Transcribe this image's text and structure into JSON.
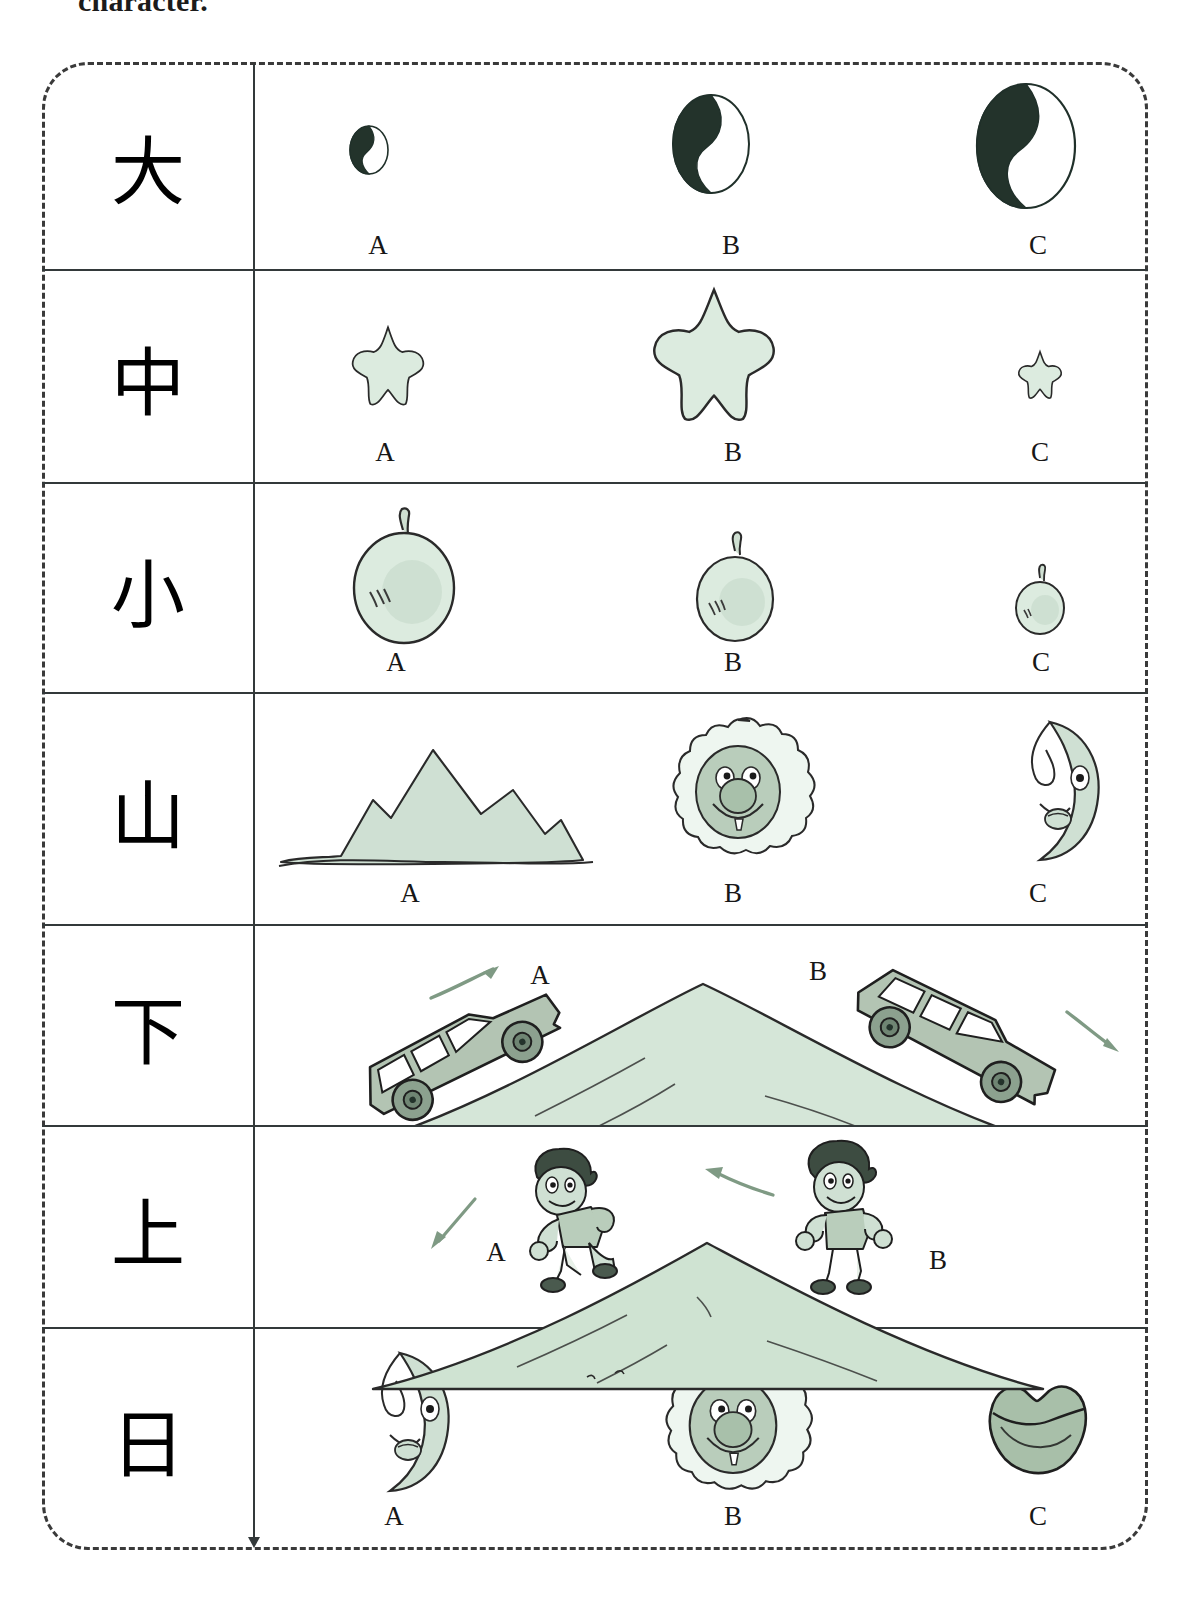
{
  "instruction": {
    "text": "character."
  },
  "worksheet": {
    "title": "Chinese character picture-matching worksheet",
    "border_style": "dashed-rounded",
    "columns": [
      "character",
      "options"
    ],
    "option_labels": [
      "A",
      "B",
      "C"
    ],
    "colors": {
      "ink": "#33393a",
      "pale_green": "#dcebdf",
      "mid_green": "#b9cdbb",
      "sage_green": "#b3c4b3",
      "deep_green": "#7f9a84",
      "dark_ink": "#1b1b1b",
      "yin_dark": "#23332b"
    },
    "rows": [
      {
        "character": "大",
        "meaning": "big",
        "theme": "yin-yang circles increasing in size",
        "options": [
          {
            "label": "A",
            "icon": "yinyang-small-icon",
            "size": "small"
          },
          {
            "label": "B",
            "icon": "yinyang-medium-icon",
            "size": "medium"
          },
          {
            "label": "C",
            "icon": "yinyang-large-icon",
            "size": "large"
          }
        ]
      },
      {
        "character": "中",
        "meaning": "middle",
        "theme": "stars of differing sizes",
        "options": [
          {
            "label": "A",
            "icon": "star-medium-icon",
            "size": "medium"
          },
          {
            "label": "B",
            "icon": "star-large-icon",
            "size": "large"
          },
          {
            "label": "C",
            "icon": "star-small-icon",
            "size": "small"
          }
        ]
      },
      {
        "character": "小",
        "meaning": "small",
        "theme": "apples decreasing in size",
        "options": [
          {
            "label": "A",
            "icon": "apple-large-icon",
            "size": "large"
          },
          {
            "label": "B",
            "icon": "apple-medium-icon",
            "size": "medium"
          },
          {
            "label": "C",
            "icon": "apple-small-icon",
            "size": "small"
          }
        ]
      },
      {
        "character": "山",
        "meaning": "mountain",
        "theme": "mountain, sun face, moon face",
        "options": [
          {
            "label": "A",
            "icon": "mountain-range-icon",
            "size": ""
          },
          {
            "label": "B",
            "icon": "sun-face-icon",
            "size": ""
          },
          {
            "label": "C",
            "icon": "moon-face-icon",
            "size": ""
          }
        ]
      },
      {
        "character": "下",
        "meaning": "down",
        "theme": "cars driving up and down a hill",
        "options": [
          {
            "label": "A",
            "icon": "car-uphill-icon",
            "direction": "up"
          },
          {
            "label": "B",
            "icon": "car-downhill-icon",
            "direction": "down"
          }
        ]
      },
      {
        "character": "上",
        "meaning": "up",
        "theme": "people walking down and up a hill",
        "options": [
          {
            "label": "A",
            "icon": "person-downhill-icon",
            "direction": "down"
          },
          {
            "label": "B",
            "icon": "person-uphill-icon",
            "direction": "up"
          }
        ]
      },
      {
        "character": "日",
        "meaning": "sun / day",
        "theme": "moon face, sun face, lips",
        "options": [
          {
            "label": "A",
            "icon": "moon-face-icon",
            "size": ""
          },
          {
            "label": "B",
            "icon": "sun-face-icon",
            "size": ""
          },
          {
            "label": "C",
            "icon": "lips-icon",
            "size": ""
          }
        ]
      }
    ]
  }
}
